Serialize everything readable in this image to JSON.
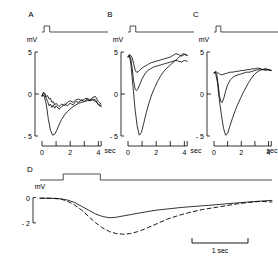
{
  "figure": {
    "type": "multi-panel-electrophysiology-traces",
    "background": "#ffffff",
    "ink": "#000000"
  },
  "panels": [
    {
      "letter": "A",
      "y_unit": "mV",
      "y_ticks": [
        "5",
        "0",
        "- 5"
      ],
      "x_ticks": [
        "0",
        "2",
        "4"
      ],
      "x_unit": "sec"
    },
    {
      "letter": "B",
      "y_unit": "mV",
      "y_ticks": [
        "5",
        "0",
        "- 5"
      ],
      "x_ticks": [
        "0",
        "2",
        "4"
      ],
      "x_unit": "sec"
    },
    {
      "letter": "C",
      "y_unit": "mV",
      "y_ticks": [
        "5",
        "0",
        "- 5"
      ],
      "x_ticks": [
        "0",
        "2",
        "4"
      ],
      "x_unit": "sec"
    },
    {
      "letter": "D",
      "y_unit": "mV",
      "y_ticks": [
        "0",
        "- 2"
      ],
      "scalebar_label": "1 sec"
    }
  ],
  "chart_data": {
    "type": "line",
    "title": "",
    "xlabel": "sec",
    "ylabel": "mV",
    "grid": false,
    "legend": "none",
    "panels": [
      {
        "id": "A",
        "label": "A",
        "xlim": [
          0,
          4.4
        ],
        "ylim": [
          -5,
          5
        ],
        "xlabel": "sec",
        "ylabel": "mV",
        "xticks": [
          0,
          1,
          2,
          3,
          4
        ],
        "xticklabels": [
          "0",
          "",
          "2",
          "",
          "4"
        ],
        "yticks": [
          -5,
          0,
          5
        ],
        "yticklabels": [
          "- 5",
          "0",
          "5"
        ],
        "stimulus": {
          "onset": 0.15,
          "offset": 0.55,
          "amplitude": 1
        },
        "series": [
          {
            "name": "trace-1",
            "style": "solid",
            "x": [
              0.0,
              0.1,
              0.2,
              0.3,
              0.4,
              0.5,
              0.6,
              0.7,
              0.8,
              0.9,
              1.0,
              1.2,
              1.4,
              1.6,
              1.8,
              2.0,
              2.2,
              2.4,
              2.6,
              2.8,
              3.0,
              3.2,
              3.4,
              3.6,
              3.8,
              4.0,
              4.2
            ],
            "y": [
              -0.2,
              0.2,
              0.1,
              -0.3,
              -0.2,
              -0.6,
              -0.5,
              -1.0,
              -0.9,
              -1.3,
              -1.1,
              -1.5,
              -1.2,
              -1.4,
              -1.0,
              -0.8,
              -1.0,
              -0.7,
              -0.6,
              -0.8,
              -0.6,
              -0.5,
              -0.7,
              -0.4,
              -0.3,
              -0.9,
              -1.2
            ]
          },
          {
            "name": "trace-2",
            "style": "solid",
            "x": [
              0.0,
              0.1,
              0.2,
              0.3,
              0.4,
              0.5,
              0.6,
              0.7,
              0.8,
              0.9,
              1.0,
              1.2,
              1.4,
              1.6,
              1.8,
              2.0,
              2.2,
              2.4,
              2.6,
              2.8,
              3.0,
              3.2,
              3.4,
              3.6,
              3.8,
              4.0,
              4.2
            ],
            "y": [
              -0.3,
              0.1,
              -0.1,
              -0.5,
              -0.9,
              -1.4,
              -1.2,
              -1.6,
              -1.3,
              -1.7,
              -1.4,
              -1.8,
              -1.5,
              -1.2,
              -1.4,
              -1.1,
              -1.3,
              -0.9,
              -1.0,
              -0.7,
              -0.9,
              -0.6,
              -0.8,
              -0.6,
              -0.7,
              -1.3,
              -1.5
            ]
          },
          {
            "name": "trace-3-large",
            "style": "solid",
            "x": [
              0.0,
              0.15,
              0.3,
              0.45,
              0.6,
              0.75,
              0.9,
              1.05,
              1.2,
              1.4,
              1.6,
              1.8,
              2.0,
              2.2,
              2.4,
              2.6,
              2.8,
              3.0,
              3.2,
              3.4,
              3.6,
              3.8,
              4.0,
              4.2
            ],
            "y": [
              -0.2,
              -0.2,
              -1.2,
              -3.0,
              -4.3,
              -4.9,
              -4.8,
              -4.3,
              -3.7,
              -3.0,
              -2.5,
              -2.1,
              -1.8,
              -1.5,
              -1.3,
              -1.1,
              -1.0,
              -0.9,
              -0.8,
              -0.8,
              -0.7,
              -0.9,
              -1.2,
              -1.4
            ]
          }
        ]
      },
      {
        "id": "B",
        "label": "B",
        "xlim": [
          0,
          4.4
        ],
        "ylim": [
          -5,
          5
        ],
        "xlabel": "sec",
        "ylabel": "mV",
        "xticks": [
          0,
          1,
          2,
          3,
          4
        ],
        "xticklabels": [
          "0",
          "",
          "2",
          "",
          "4"
        ],
        "yticks": [
          -5,
          0,
          5
        ],
        "yticklabels": [
          "- 5",
          "0",
          "5"
        ],
        "stimulus": {
          "onset": 0.15,
          "offset": 0.55,
          "amplitude": 1
        },
        "series": [
          {
            "name": "trace-1",
            "style": "solid",
            "x": [
              0.0,
              0.1,
              0.2,
              0.3,
              0.4,
              0.5,
              0.6,
              0.7,
              0.8,
              1.0,
              1.2,
              1.4,
              1.6,
              1.8,
              2.0,
              2.2,
              2.4,
              2.6,
              2.8,
              3.0,
              3.2,
              3.4,
              3.6,
              3.8,
              4.0,
              4.2
            ],
            "y": [
              4.5,
              4.7,
              4.6,
              4.3,
              3.6,
              2.9,
              2.6,
              2.6,
              2.8,
              3.1,
              3.3,
              3.5,
              3.7,
              3.8,
              3.9,
              4.0,
              4.1,
              4.2,
              4.3,
              4.4,
              4.6,
              4.8,
              4.7,
              4.5,
              4.7,
              4.6
            ]
          },
          {
            "name": "trace-2",
            "style": "solid",
            "x": [
              0.0,
              0.1,
              0.2,
              0.3,
              0.4,
              0.5,
              0.6,
              0.7,
              0.8,
              0.9,
              1.0,
              1.2,
              1.4,
              1.6,
              1.8,
              2.0,
              2.2,
              2.4,
              2.6,
              2.8,
              3.0,
              3.2,
              3.4,
              3.6,
              3.8,
              4.0,
              4.2
            ],
            "y": [
              4.4,
              4.6,
              4.2,
              3.0,
              1.5,
              0.6,
              0.4,
              0.6,
              1.0,
              1.4,
              1.8,
              2.4,
              2.8,
              3.0,
              3.2,
              3.3,
              3.4,
              3.5,
              3.6,
              3.7,
              3.8,
              3.9,
              4.0,
              3.9,
              3.8,
              4.0,
              3.9
            ]
          },
          {
            "name": "trace-3-large",
            "style": "solid",
            "x": [
              0.0,
              0.1,
              0.2,
              0.35,
              0.5,
              0.65,
              0.8,
              0.95,
              1.1,
              1.3,
              1.5,
              1.7,
              1.9,
              2.1,
              2.3,
              2.5,
              2.7,
              2.9,
              3.1,
              3.3,
              3.5,
              3.7,
              3.9,
              4.1,
              4.2
            ],
            "y": [
              4.4,
              4.5,
              3.6,
              1.0,
              -1.8,
              -3.8,
              -4.9,
              -4.6,
              -3.6,
              -2.2,
              -1.0,
              0.0,
              0.8,
              1.5,
              2.1,
              2.6,
              3.0,
              3.3,
              3.6,
              3.9,
              4.2,
              4.5,
              4.8,
              4.7,
              4.6
            ]
          }
        ]
      },
      {
        "id": "C",
        "label": "C",
        "xlim": [
          0,
          4.4
        ],
        "ylim": [
          -5,
          5
        ],
        "xlabel": "sec",
        "ylabel": "mV",
        "xticks": [
          0,
          1,
          2,
          3,
          4
        ],
        "xticklabels": [
          "0",
          "",
          "2",
          "",
          "4"
        ],
        "yticks": [
          -5,
          0,
          5
        ],
        "yticklabels": [
          "- 5",
          "0",
          "5"
        ],
        "stimulus": {
          "onset": 0.15,
          "offset": 0.5,
          "amplitude": 1
        },
        "series": [
          {
            "name": "trace-1",
            "style": "solid",
            "x": [
              0.0,
              0.1,
              0.2,
              0.3,
              0.4,
              0.5,
              0.6,
              0.8,
              1.0,
              1.2,
              1.4,
              1.6,
              1.8,
              2.0,
              2.2,
              2.4,
              2.6,
              2.8,
              3.0,
              3.2,
              3.4,
              3.6,
              3.8,
              4.0,
              4.2
            ],
            "y": [
              2.5,
              2.7,
              2.6,
              2.5,
              2.4,
              2.3,
              2.3,
              2.4,
              2.5,
              2.6,
              2.6,
              2.7,
              2.7,
              2.8,
              2.8,
              2.9,
              2.9,
              3.0,
              3.0,
              3.1,
              3.0,
              2.9,
              3.0,
              2.9,
              2.8
            ]
          },
          {
            "name": "trace-2",
            "style": "solid",
            "x": [
              0.0,
              0.1,
              0.2,
              0.3,
              0.4,
              0.5,
              0.6,
              0.7,
              0.8,
              0.9,
              1.0,
              1.2,
              1.4,
              1.6,
              1.8,
              2.0,
              2.2,
              2.4,
              2.6,
              2.8,
              3.0,
              3.2,
              3.4,
              3.6,
              3.8,
              4.0,
              4.2
            ],
            "y": [
              2.5,
              2.6,
              2.4,
              1.2,
              -0.2,
              -0.9,
              -1.0,
              -0.6,
              0.0,
              0.6,
              1.1,
              1.7,
              2.0,
              2.2,
              2.3,
              2.4,
              2.5,
              2.6,
              2.6,
              2.7,
              2.8,
              2.9,
              3.0,
              2.9,
              2.8,
              2.9,
              2.8
            ]
          },
          {
            "name": "trace-3-large",
            "style": "solid",
            "x": [
              0.0,
              0.1,
              0.25,
              0.4,
              0.55,
              0.7,
              0.85,
              1.0,
              1.15,
              1.35,
              1.55,
              1.75,
              1.95,
              2.15,
              2.35,
              2.55,
              2.75,
              2.95,
              3.15,
              3.35,
              3.55,
              3.75,
              3.95,
              4.15
            ],
            "y": [
              2.5,
              2.6,
              1.4,
              -0.8,
              -2.6,
              -4.1,
              -4.9,
              -4.7,
              -3.9,
              -2.9,
              -2.0,
              -1.2,
              -0.5,
              0.2,
              0.8,
              1.4,
              1.9,
              2.3,
              2.6,
              2.8,
              2.9,
              3.0,
              2.9,
              2.8
            ]
          }
        ]
      },
      {
        "id": "D",
        "label": "D",
        "xlim": [
          0,
          10
        ],
        "ylim": [
          -3.2,
          0.6
        ],
        "ylabel": "mV",
        "yticks": [
          0,
          -2
        ],
        "yticklabels": [
          "0",
          "- 2"
        ],
        "scalebar": {
          "label": "1 sec",
          "length_units": 1.6
        },
        "stimulus": {
          "onset": 1.0,
          "offset": 2.6,
          "amplitude": 1
        },
        "series": [
          {
            "name": "trace-solid",
            "style": "solid",
            "x": [
              0.0,
              0.3,
              0.6,
              0.9,
              1.2,
              1.5,
              1.8,
              2.1,
              2.4,
              2.7,
              3.0,
              3.3,
              3.6,
              3.9,
              4.2,
              4.5,
              5.0,
              5.5,
              6.0,
              6.5,
              7.0,
              7.5,
              8.0,
              8.5,
              9.0,
              9.5,
              10.0
            ],
            "y": [
              -0.05,
              -0.05,
              -0.06,
              -0.1,
              -0.2,
              -0.4,
              -0.7,
              -1.0,
              -1.3,
              -1.5,
              -1.6,
              -1.55,
              -1.45,
              -1.35,
              -1.25,
              -1.15,
              -1.0,
              -0.9,
              -0.8,
              -0.72,
              -0.65,
              -0.58,
              -0.5,
              -0.42,
              -0.35,
              -0.28,
              -0.22
            ]
          },
          {
            "name": "trace-dashed",
            "style": "dashed",
            "x": [
              0.0,
              0.3,
              0.6,
              0.9,
              1.2,
              1.5,
              1.8,
              2.1,
              2.4,
              2.7,
              3.0,
              3.3,
              3.6,
              3.9,
              4.2,
              4.5,
              5.0,
              5.5,
              6.0,
              6.5,
              7.0,
              7.5,
              8.0,
              8.5,
              9.0,
              9.5,
              10.0
            ],
            "y": [
              -0.05,
              -0.05,
              -0.07,
              -0.12,
              -0.3,
              -0.6,
              -1.0,
              -1.5,
              -2.0,
              -2.4,
              -2.7,
              -2.85,
              -2.9,
              -2.85,
              -2.7,
              -2.5,
              -2.1,
              -1.7,
              -1.4,
              -1.15,
              -0.95,
              -0.8,
              -0.65,
              -0.5,
              -0.38,
              -0.3,
              -0.35
            ]
          }
        ]
      }
    ]
  }
}
